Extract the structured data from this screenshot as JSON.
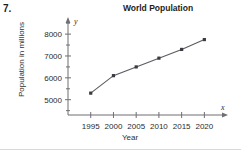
{
  "problem": {
    "number": "7."
  },
  "chart_data": {
    "type": "line",
    "title": "World Population",
    "xlabel": "Year",
    "ylabel": "Population in millions",
    "x": [
      1995,
      2000,
      2005,
      2010,
      2015,
      2020
    ],
    "values": [
      5300,
      6100,
      6500,
      6900,
      7300,
      7750
    ],
    "categories": [
      "1995",
      "2000",
      "2005",
      "2010",
      "2015",
      "2020"
    ],
    "xticklabels": [
      "1995",
      "2000",
      "2005",
      "2010",
      "2015",
      "2020"
    ],
    "yticklabels": [
      "5000",
      "6000",
      "7000",
      "8000"
    ],
    "ytickvalues": [
      5000,
      6000,
      7000,
      8000
    ],
    "yminorticks": [
      4500,
      5500,
      6500,
      7500,
      8500
    ],
    "xlim": [
      1990,
      2023
    ],
    "ylim": [
      4300,
      8600
    ],
    "grid": false,
    "legend": null,
    "axis_letters": {
      "x": "x",
      "y": "y"
    },
    "marker": "square",
    "line_color": "#5a5a62",
    "marker_color": "#3a3a40",
    "axis_color": "#6e6e74"
  }
}
